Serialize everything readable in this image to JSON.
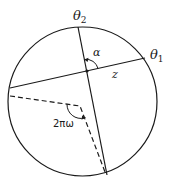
{
  "figure": {
    "labels": {
      "theta2": "θ",
      "theta2_sub": "2",
      "theta1": "θ",
      "theta1_sub": "1",
      "alpha": "α",
      "z": "z",
      "angle": "2πω"
    },
    "colors": {
      "stroke": "#1a1a1a",
      "background": "#ffffff"
    }
  }
}
